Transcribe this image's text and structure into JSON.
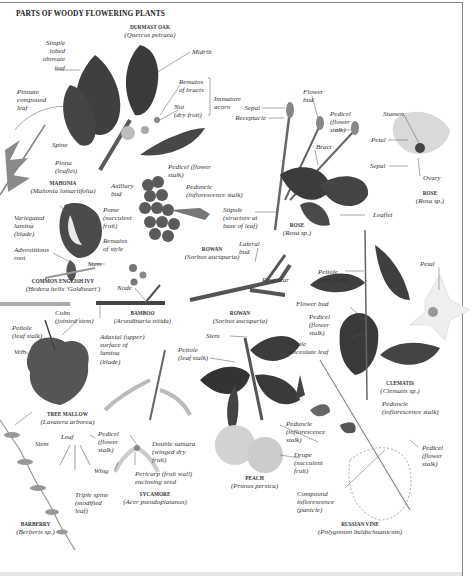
{
  "title": "PARTS OF WOODY FLOWERING PLANTS",
  "specimens": {
    "durmast_oak": {
      "name": "DURMAST OAK",
      "latin": "(Quercus petraea)"
    },
    "mahonia": {
      "name": "MAHONIA",
      "latin": "(Mahonia lomariifolia)"
    },
    "common_english_ivy": {
      "name": "COMMON ENGLISH IVY",
      "latin": "(Hedera helix 'Goldheart')"
    },
    "bamboo": {
      "name": "BAMBOO",
      "latin": "(Arundinaria nitida)"
    },
    "rowan_berries": {
      "name": "ROWAN",
      "latin": "(Sorbus aucuparia)"
    },
    "rowan_twig": {
      "name": "ROWAN",
      "latin": "(Sorbus aucuparia)"
    },
    "rose_stem": {
      "name": "ROSE",
      "latin": "(Rosa sp.)"
    },
    "rose_flower": {
      "name": "ROSE",
      "latin": "(Rosa sp.)"
    },
    "clematis": {
      "name": "CLEMATIS",
      "latin": "(Clematis sp.)"
    },
    "tree_mallow": {
      "name": "TREE MALLOW",
      "latin": "(Lavatera arborea)"
    },
    "sycamore": {
      "name": "SYCAMORE",
      "latin": "(Acer pseudoplatanus)"
    },
    "peach": {
      "name": "PEACH",
      "latin": "(Prunus persica)"
    },
    "russian_vine": {
      "name": "RUSSIAN VINE",
      "latin": "(Polygonum baldschuanicum)"
    },
    "barberry": {
      "name": "BARBERRY",
      "latin": "(Berberis sp.)"
    }
  },
  "labels": {
    "simple_lobed_leaf": "Simple\nlobed\nobovate\nleaf",
    "midrib": "Midrib",
    "remains_of_bracts": "Remains\nof bracts",
    "nut": "Nut\n(dry fruit)",
    "immature_acorn": "Immature\nacorn",
    "pinnate_compound_leaf": "Pinnate\ncompound\nleaf",
    "spine": "Spine",
    "pinna": "Pinna\n(leaflet)",
    "axillary_bud": "Axillary\nbud",
    "pedicel_rowan": "Pedicel (flower\nstalk)",
    "peduncle_rowan": "Peduncle\n(inflorescence stalk)",
    "pome": "Pome\n(succulent\nfruit)",
    "remains_of_style": "Remains\nof style",
    "variegated_lamina": "Variegated\nlamina\n(blade)",
    "adventitious_root": "Adventitious\nroot",
    "stem_ivy": "Stem",
    "node": "Node",
    "culm": "Culm\n(jointed stem)",
    "sepal_rose_bud": "Sepal",
    "receptacle": "Receptacle",
    "flower_bud_rose": "Flower\nbud",
    "pedicel_rose": "Pedicel\n(flower\nstalk)",
    "bract": "Bract",
    "stipule": "Stipule\n(structure at\nbase of leaf)",
    "leaflet": "Leaflet",
    "stamen": "Stamen",
    "petal_rose": "Petal",
    "sepal_rose_flower": "Sepal",
    "ovary": "Ovary",
    "lateral_bud": "Lateral\nbud",
    "ring_scar": "Ring scar",
    "petiole_clematis": "Petiole\n(leaf stalk)",
    "petal_clematis": "Petal",
    "flower_bud_clematis": "Flower bud",
    "pedicel_clematis": "Pedicel\n(flower\nstalk)",
    "petiole_mallow": "Petiole\n(leaf stalk)",
    "vein": "Vein",
    "adaxial_surface": "Adaxial (upper)\nsurface of\nlamina\n(blade)",
    "stem_peach": "Stem",
    "petiole_peach": "Petiole\n(leaf stalk)",
    "simple_lanceolate_leaf": "Simple\nlanceolate leaf",
    "peduncle_peach": "Peduncle\n(inflorescence\nstalk)",
    "drupe": "Drupe\n(succulent\nfruit)",
    "peduncle_vine": "Peduncle\n(inflorescence stalk)",
    "pedicel_vine": "Pedicel\n(flower\nstalk)",
    "compound_inflorescence": "Compound\ninflorescence\n(panicle)",
    "stem_barberry": "Stem",
    "leaf_barberry": "Leaf",
    "triple_spine": "Triple spine\n(modified\nleaf)",
    "pedicel_sycamore": "Pedicel\n(flower\nstalk)",
    "double_samara": "Double samara\n(winged dry\nfruit)",
    "wing": "Wing",
    "pericarp": "Pericarp (fruit wall)\nenclosing seed"
  },
  "colors": {
    "leaf_dark": "#3f3f3f",
    "leaf_mid": "#6a6a6a",
    "leaf_light": "#9a9a9a",
    "stem": "#5a5a5a",
    "fruit": "#d6d6d6",
    "petal": "#ececec",
    "rule": "#8a8a8a"
  }
}
